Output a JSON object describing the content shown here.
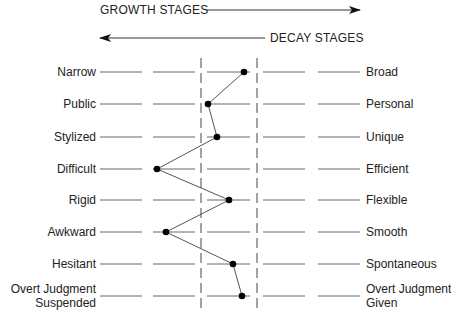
{
  "header": {
    "growth_label": "GROWTH STAGES",
    "decay_label": "DECAY STAGES",
    "growth_direction": "right",
    "decay_direction": "left"
  },
  "scales": [
    {
      "left": "Narrow",
      "right": "Broad",
      "position": 5
    },
    {
      "left": "Public",
      "right": "Personal",
      "position": 3
    },
    {
      "left": "Stylized",
      "right": "Unique",
      "position": 3.5
    },
    {
      "left": "Difficult",
      "right": "Efficient",
      "position": 2
    },
    {
      "left": "Rigid",
      "right": "Flexible",
      "position": 3.7
    },
    {
      "left": "Awkward",
      "right": "Smooth",
      "position": 2.2
    },
    {
      "left": "Hesitant",
      "right": "Spontaneous",
      "position": 3.8
    },
    {
      "left": "Overt Judgment Suspended",
      "left_line1": "Overt Judgment",
      "left_line2": "Suspended",
      "right": "Overt Judgment Given",
      "right_line1": "Overt Judgment",
      "right_line2": "Given",
      "position": 4
    }
  ],
  "points": [
    {
      "x": 244,
      "y": 72
    },
    {
      "x": 208,
      "y": 104
    },
    {
      "x": 217,
      "y": 137
    },
    {
      "x": 157,
      "y": 169
    },
    {
      "x": 229,
      "y": 200
    },
    {
      "x": 166,
      "y": 232
    },
    {
      "x": 233,
      "y": 264
    },
    {
      "x": 242,
      "y": 296
    }
  ],
  "colors": {
    "line": "#555555",
    "dot": "#000000",
    "text": "#222222"
  }
}
